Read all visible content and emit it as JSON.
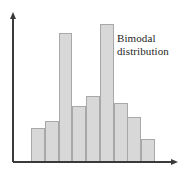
{
  "figure": {
    "width": 186,
    "height": 175,
    "background": "#ffffff"
  },
  "annotations": {
    "bimodal": {
      "line1": "Bimodal",
      "line2": "distribution",
      "color": "#1d1d1d"
    }
  },
  "axes": {
    "origin_x": 13,
    "baseline_y": 162,
    "y_axis_top": 12,
    "x_axis_right": 178,
    "color": "#3a3a3a",
    "y_label": "",
    "x_label": "",
    "y_ticks": [],
    "x_ticks": []
  },
  "style": {
    "bar_fill": "#d8d8d8",
    "bar_stroke": "#a8a8a8"
  },
  "chart_data": {
    "type": "bar",
    "title": "",
    "subtitle": "",
    "xlabel": "",
    "ylabel": "",
    "grid": false,
    "legend": false,
    "annotations": [
      "Bimodal distribution"
    ],
    "categories": [
      "1",
      "2",
      "3",
      "4",
      "5",
      "6",
      "7",
      "8",
      "9"
    ],
    "values": [
      34,
      41,
      129,
      56,
      66,
      138,
      59,
      45,
      23
    ],
    "ylim": [
      0,
      150
    ],
    "bar_left_px": [
      31.0,
      44.8,
      58.6,
      72.3,
      86.1,
      99.9,
      113.7,
      127.4,
      141.2
    ],
    "bar_width_px": 13.8,
    "bar_top_px": [
      128,
      121,
      33,
      106,
      96,
      24,
      103,
      117,
      139
    ],
    "baseline_px": 162
  }
}
